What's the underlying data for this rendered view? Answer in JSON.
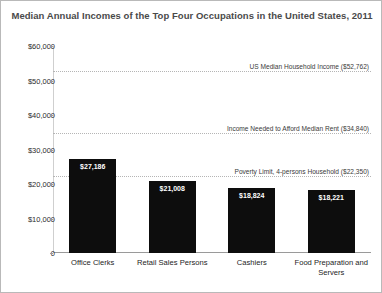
{
  "chart_data": {
    "type": "bar",
    "title": "Median Annual Incomes of the Top Four Occupations in the United States, 2011",
    "xlabel": "",
    "ylabel": "",
    "ylim": [
      0,
      60000
    ],
    "yticks": [
      {
        "value": 60000,
        "label": "$60,000"
      },
      {
        "value": 50000,
        "label": "$50,000"
      },
      {
        "value": 40000,
        "label": "$40,000"
      },
      {
        "value": 30000,
        "label": "$30,000"
      },
      {
        "value": 20000,
        "label": "$20,000"
      },
      {
        "value": 10000,
        "label": "$10,000"
      },
      {
        "value": 0,
        "label": "0"
      }
    ],
    "categories": [
      "Office Clerks",
      "Retail Sales Persons",
      "Cashiers",
      "Food Preparation and Servers"
    ],
    "values": [
      27186,
      21008,
      18824,
      18221
    ],
    "value_labels": [
      "$27,186",
      "$21,008",
      "$18,824",
      "$18,221"
    ],
    "bar_color": "#0d0d0d",
    "grid": false,
    "legend": "none",
    "reference_lines": [
      {
        "value": 52762,
        "label": "US Median Household Income ($52,762)",
        "style": "dotted",
        "color": "#b5b5b5"
      },
      {
        "value": 34840,
        "label": "Income Needed to Afford Median Rent ($34,840)",
        "style": "dotted",
        "color": "#b5b5b5"
      },
      {
        "value": 22350,
        "label": "Poverty Limit, 4-persons Household ($22,350)",
        "style": "dotted",
        "color": "#b5b5b5"
      }
    ]
  }
}
